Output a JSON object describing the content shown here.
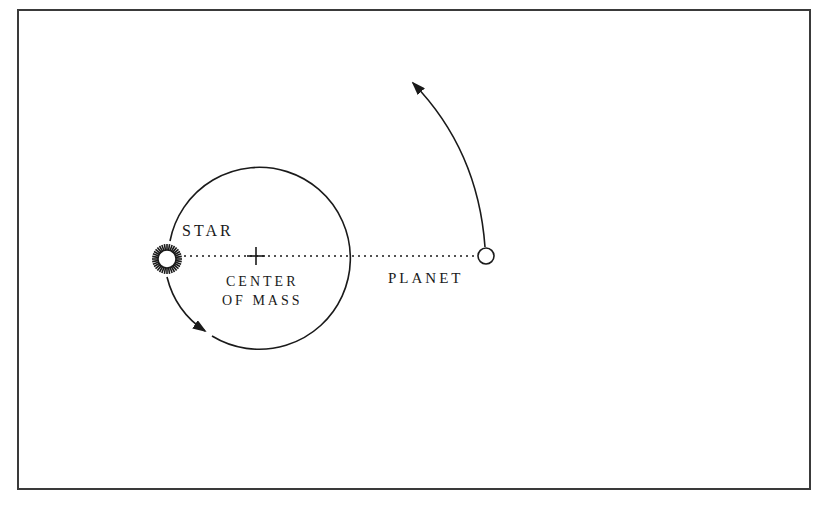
{
  "diagram": {
    "labels": {
      "star": "STAR",
      "center_of_mass_line1": "CENTER",
      "center_of_mass_line2": "OF MASS",
      "planet": "PLANET"
    },
    "colors": {
      "stroke": "#1a1a1a",
      "frame": "#3a3a3a",
      "background": "#ffffff"
    },
    "geometry": {
      "star_orbit": {
        "cx": 256,
        "cy": 257,
        "r": 91
      },
      "star": {
        "cx": 167,
        "cy": 259,
        "inner_r": 9,
        "outer_r": 15,
        "rays": 36
      },
      "center_of_mass": {
        "x": 256,
        "y": 256
      },
      "planet": {
        "cx": 486,
        "cy": 256,
        "r": 8
      },
      "planet_arrow_tip": {
        "x": 413,
        "y": 83
      },
      "star_arrow_tip": {
        "x": 205,
        "y": 330
      }
    }
  }
}
